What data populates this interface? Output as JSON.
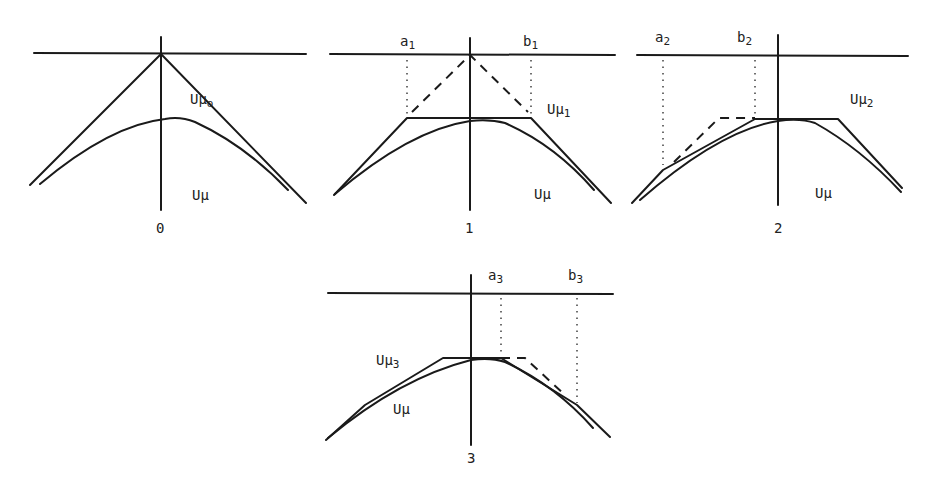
{
  "figure": {
    "panels": [
      {
        "id": "0",
        "caption": "0",
        "curve_label": "Uμ",
        "approx_label": "Uμ",
        "approx_sub": "o",
        "interval_labels": []
      },
      {
        "id": "1",
        "caption": "1",
        "curve_label": "Uμ",
        "approx_label": "Uμ",
        "approx_sub": "1",
        "interval_labels": [
          {
            "name": "a",
            "sub": "1"
          },
          {
            "name": "b",
            "sub": "1"
          }
        ]
      },
      {
        "id": "2",
        "caption": "2",
        "curve_label": "Uμ",
        "approx_label": "Uμ",
        "approx_sub": "2",
        "interval_labels": [
          {
            "name": "a",
            "sub": "2"
          },
          {
            "name": "b",
            "sub": "2"
          }
        ]
      },
      {
        "id": "3",
        "caption": "3",
        "curve_label": "Uμ",
        "approx_label": "Uμ",
        "approx_sub": "3",
        "interval_labels": [
          {
            "name": "a",
            "sub": "3"
          },
          {
            "name": "b",
            "sub": "3"
          }
        ]
      }
    ]
  },
  "colors": {
    "ink": "#1a1a1a",
    "background": "#ffffff"
  }
}
